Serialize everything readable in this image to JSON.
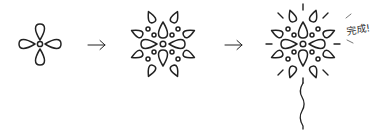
{
  "diagram": {
    "stroke_color": "#222222",
    "stages": [
      {
        "id": "stage-1",
        "name": "simple",
        "center": [
          40,
          44
        ],
        "petals": 4
      },
      {
        "id": "stage-2",
        "name": "expanded",
        "center": [
          163,
          44
        ],
        "petals": 16
      },
      {
        "id": "stage-3",
        "name": "complete",
        "center": [
          303,
          44
        ],
        "petals": 16,
        "rays": true,
        "stem": true
      }
    ],
    "arrows": [
      {
        "from": "stage-1",
        "to": "stage-2",
        "glyph": "→"
      },
      {
        "from": "stage-2",
        "to": "stage-3",
        "glyph": "→"
      }
    ],
    "completion_label": "完成!"
  }
}
